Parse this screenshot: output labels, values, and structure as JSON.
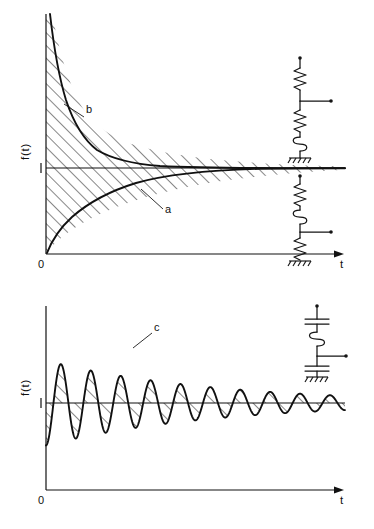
{
  "figure": {
    "background_color": "#ffffff",
    "ink_color": "#111111"
  },
  "panels": [
    {
      "id": "top",
      "axes": {
        "ylabel": "f(t)",
        "xlabel": "t",
        "origin_label": "0",
        "ytick_label": "1"
      },
      "curve_labels": [
        {
          "text": "b",
          "describes": "decaying-curve-above-unity"
        },
        {
          "text": "a",
          "describes": "rising-curve-below-unity"
        }
      ],
      "circuits": [
        {
          "name": "circuit-b-upper",
          "elements": [
            "resistor",
            "output-tap",
            "resistor",
            "inductor",
            "ground"
          ]
        },
        {
          "name": "circuit-a-lower",
          "elements": [
            "resistor",
            "inductor",
            "output-tap",
            "resistor",
            "ground"
          ]
        }
      ]
    },
    {
      "id": "bottom",
      "axes": {
        "ylabel": "f(t)",
        "xlabel": "t",
        "origin_label": "0",
        "ytick_label": "1"
      },
      "curve_labels": [
        {
          "text": "c",
          "describes": "damped-oscillation"
        }
      ],
      "circuits": [
        {
          "name": "circuit-c",
          "elements": [
            "capacitor",
            "inductor",
            "output-tap",
            "capacitor",
            "ground"
          ]
        }
      ]
    }
  ],
  "chart_data": [
    {
      "type": "line",
      "id": "top-panel",
      "title": "",
      "xlabel": "t",
      "ylabel": "f(t)",
      "xlim": [
        0,
        10
      ],
      "ylim": [
        0,
        4.1
      ],
      "grid": false,
      "legend": "none",
      "yticks": [
        1
      ],
      "ytick_labels": [
        "1"
      ],
      "xticks": [
        0
      ],
      "xtick_labels": [
        "0"
      ],
      "asymptote": 1,
      "annotations": [
        {
          "text": "b",
          "x": 2.05,
          "y": 2.2
        },
        {
          "text": "a",
          "x": 4.6,
          "y": 0.52
        }
      ],
      "series": [
        {
          "name": "b",
          "description": "exponential decay from large value toward unity asymptote, f(t) = 1 + A*exp(-t/tau)",
          "x": [
            0.0,
            0.12,
            0.25,
            0.4,
            0.55,
            0.7,
            0.9,
            1.1,
            1.35,
            1.6,
            1.9,
            2.2,
            2.6,
            3.0,
            3.5,
            4.0,
            4.8,
            5.6,
            6.5,
            7.5,
            8.6,
            10.0
          ],
          "y": [
            4.1,
            3.72,
            3.32,
            2.9,
            2.56,
            2.3,
            2.0,
            1.78,
            1.59,
            1.45,
            1.33,
            1.25,
            1.17,
            1.12,
            1.08,
            1.055,
            1.03,
            1.018,
            1.011,
            1.006,
            1.003,
            1.0
          ]
        },
        {
          "name": "a",
          "description": "exponential rise from zero toward unity asymptote, f(t) = 1 - exp(-t/tau)",
          "x": [
            0.0,
            0.12,
            0.25,
            0.4,
            0.55,
            0.7,
            0.9,
            1.1,
            1.35,
            1.6,
            1.9,
            2.2,
            2.6,
            3.0,
            3.5,
            4.0,
            4.8,
            5.6,
            6.5,
            7.5,
            8.6,
            10.0
          ],
          "y": [
            0.0,
            0.1,
            0.19,
            0.28,
            0.35,
            0.42,
            0.5,
            0.56,
            0.63,
            0.68,
            0.74,
            0.785,
            0.83,
            0.865,
            0.9,
            0.925,
            0.952,
            0.97,
            0.982,
            0.99,
            0.995,
            1.0
          ]
        }
      ],
      "shaded_regions": [
        {
          "between": "b",
          "and": "asymptote",
          "pattern": "diagonal-hatch-45deg"
        },
        {
          "between": "a",
          "and": "asymptote",
          "pattern": "diagonal-hatch-45deg"
        }
      ]
    },
    {
      "type": "line",
      "id": "bottom-panel",
      "title": "",
      "xlabel": "t",
      "ylabel": "f(t)",
      "xlim": [
        0,
        10
      ],
      "ylim": [
        -1.05,
        2.15
      ],
      "grid": false,
      "legend": "none",
      "yticks": [
        1
      ],
      "ytick_labels": [
        "1"
      ],
      "xticks": [
        0
      ],
      "xtick_labels": [
        "0"
      ],
      "asymptote": 1,
      "annotations": [
        {
          "text": "c",
          "x": 2.62,
          "y": 1.82
        }
      ],
      "series": [
        {
          "name": "c",
          "description": "damped sinusoid about unity, f(t) = 1 - exp(-t/tau)*cos(omega*t), 9 visible peaks of decreasing amplitude",
          "n_peaks": 9,
          "peak_amplitudes": [
            1.0,
            0.86,
            0.74,
            0.63,
            0.53,
            0.45,
            0.38,
            0.32,
            0.27
          ],
          "period": 1.0,
          "damping_tau": 5.6
        }
      ],
      "shaded_regions": [
        {
          "between": "c",
          "and": "asymptote",
          "pattern": "diagonal-hatch-45deg"
        }
      ]
    }
  ]
}
